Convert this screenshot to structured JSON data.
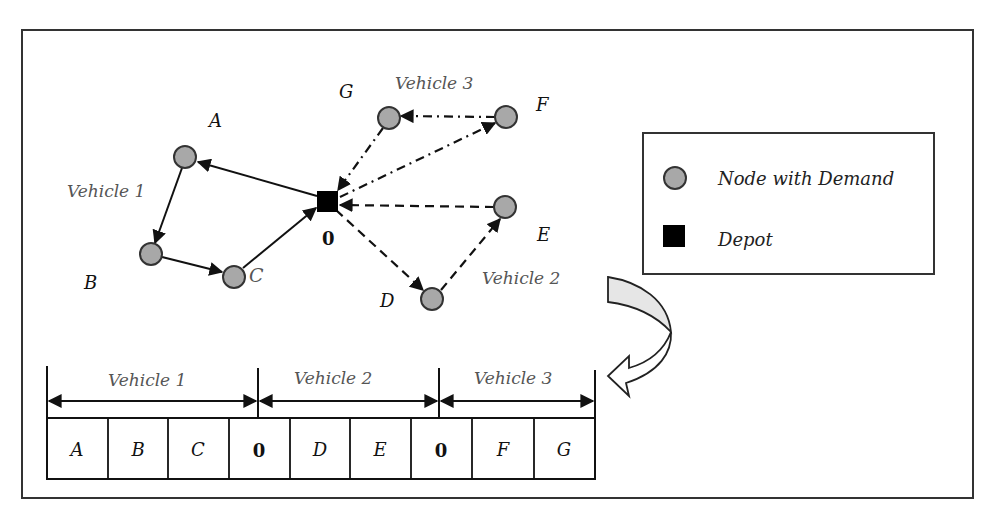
{
  "diagram": {
    "type": "vehicle-routing-encoding",
    "depot": {
      "id": "0",
      "label": "0",
      "x": 327,
      "y": 201
    },
    "nodes": [
      {
        "id": "A",
        "label": "A",
        "x": 185,
        "y": 157,
        "lx": 217,
        "ly": 127
      },
      {
        "id": "B",
        "label": "B",
        "x": 151,
        "y": 254,
        "lx": 91,
        "ly": 289
      },
      {
        "id": "C",
        "label": "C",
        "x": 234,
        "y": 277,
        "lx": 258,
        "ly": 280
      },
      {
        "id": "D",
        "label": "D",
        "x": 432,
        "y": 299,
        "lx": 387,
        "ly": 307
      },
      {
        "id": "E",
        "label": "E",
        "x": 505,
        "y": 207,
        "lx": 543,
        "ly": 241
      },
      {
        "id": "F",
        "label": "F",
        "x": 506,
        "y": 117,
        "lx": 542,
        "ly": 111
      },
      {
        "id": "G",
        "label": "G",
        "x": 389,
        "y": 118,
        "lx": 347,
        "ly": 98
      }
    ],
    "routes": [
      {
        "name": "Vehicle 1",
        "style": "solid",
        "path": [
          "0",
          "A",
          "B",
          "C",
          "0"
        ]
      },
      {
        "name": "Vehicle 2",
        "style": "dashed",
        "path": [
          "0",
          "D",
          "E",
          "0"
        ]
      },
      {
        "name": "Vehicle 3",
        "style": "dash-dot",
        "path": [
          "0",
          "F",
          "G",
          "0"
        ]
      }
    ],
    "route_labels": {
      "vehicle1": "Vehicle 1",
      "vehicle2": "Vehicle 2",
      "vehicle3": "Vehicle 3"
    },
    "legend": {
      "items": [
        {
          "symbol": "gray-circle",
          "label": "Node with Demand"
        },
        {
          "symbol": "black-square",
          "label": "Depot"
        }
      ]
    },
    "encoding": {
      "segments": [
        {
          "label": "Vehicle 1"
        },
        {
          "label": "Vehicle 2"
        },
        {
          "label": "Vehicle 3"
        }
      ],
      "cells": [
        "A",
        "B",
        "C",
        "0",
        "D",
        "E",
        "0",
        "F",
        "G"
      ]
    },
    "colors": {
      "node_fill": "#a8a8a8",
      "node_stroke": "#333333",
      "depot_fill": "#000000",
      "line": "#111111",
      "curved_arrow_fill": "#e6e6e6"
    }
  }
}
